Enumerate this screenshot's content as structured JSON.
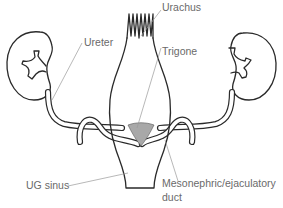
{
  "diagram": {
    "labels": {
      "urachus": "Urachus",
      "ureter": "Ureter",
      "trigone": "Trigone",
      "ug_sinus": "UG sinus",
      "mesonephric_line1": "Mesonephric/ejaculatory",
      "mesonephric_line2": "duct"
    },
    "colors": {
      "outline": "#2a2a2a",
      "trigone_fill": "#a8a8a8",
      "label_text": "#6a6a6a",
      "leader_line": "#9a9a9a",
      "background": "#ffffff"
    }
  }
}
